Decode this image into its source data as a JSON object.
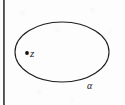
{
  "figure": {
    "kind": "geometric-diagram",
    "width": 125,
    "height": 105,
    "background_color": "#fdfdfd",
    "ink_color": "#19191b"
  },
  "curve": {
    "name": "alpha",
    "shape": "ellipse",
    "label": "α",
    "center_x": 62,
    "center_y": 52,
    "radius_x": 47,
    "radius_y": 30,
    "stroke_color": "#1d1d20",
    "stroke_width": 1.1,
    "fill": "none",
    "label_x": 90,
    "label_y": 87
  },
  "point": {
    "name": "z",
    "label": "z",
    "x": 27,
    "y": 53,
    "radius": 1.9,
    "fill_color": "#111113",
    "label_x": 33,
    "label_y": 54,
    "position_note": "interior"
  },
  "page_edge": {
    "name": "scan-gutter",
    "orientation": "vertical",
    "x": 3,
    "width": 2,
    "color": "#18181a"
  }
}
